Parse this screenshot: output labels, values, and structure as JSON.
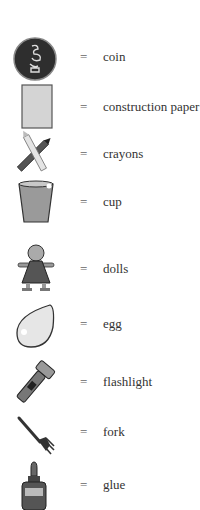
{
  "legend": {
    "equals_sign": "=",
    "items": [
      {
        "icon": "coin-icon",
        "label": "coin",
        "top": 34
      },
      {
        "icon": "construction-paper-icon",
        "label": "construction paper",
        "top": 82
      },
      {
        "icon": "crayons-icon",
        "label": "crayons",
        "top": 130
      },
      {
        "icon": "cup-icon",
        "label": "cup",
        "top": 178
      },
      {
        "icon": "doll-icon",
        "label": "dolls",
        "top": 243
      },
      {
        "icon": "egg-icon",
        "label": "egg",
        "top": 300
      },
      {
        "icon": "flashlight-icon",
        "label": "flashlight",
        "top": 357
      },
      {
        "icon": "fork-icon",
        "label": "fork",
        "top": 414
      },
      {
        "icon": "glue-icon",
        "label": "glue",
        "top": 460
      }
    ]
  }
}
